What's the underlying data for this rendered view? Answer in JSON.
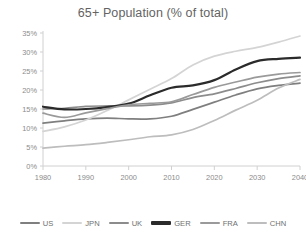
{
  "chart_data": {
    "type": "line",
    "title": "65+ Population (% of total)",
    "xlabel": "",
    "ylabel": "",
    "grid": false,
    "legend_position": "bottom",
    "x": [
      1980,
      1985,
      1990,
      1995,
      2000,
      2005,
      2010,
      2015,
      2020,
      2025,
      2030,
      2035,
      2040
    ],
    "xlim": [
      1980,
      2040
    ],
    "ylim": [
      0,
      35
    ],
    "x_ticks": [
      "1980",
      "1990",
      "2000",
      "2010",
      "2020",
      "2030",
      "2040"
    ],
    "y_ticks": [
      "0%",
      "5%",
      "10%",
      "15%",
      "20%",
      "25%",
      "30%",
      "35%"
    ],
    "y_tick_values": [
      0,
      5,
      10,
      15,
      20,
      25,
      30,
      35
    ],
    "series": [
      {
        "name": "US",
        "color": "#7f7f7f",
        "values": [
          11.3,
          11.9,
          12.4,
          12.6,
          12.4,
          12.4,
          13.1,
          14.9,
          16.8,
          18.7,
          20.3,
          21.2,
          21.8
        ]
      },
      {
        "name": "JPN",
        "color": "#d4d4d4",
        "values": [
          9.1,
          10.3,
          12.1,
          14.6,
          17.4,
          20.2,
          23.0,
          26.6,
          28.9,
          30.2,
          31.2,
          32.6,
          34.2
        ]
      },
      {
        "name": "UK",
        "color": "#8c8c8c",
        "values": [
          15.0,
          15.2,
          15.7,
          15.8,
          15.8,
          16.0,
          16.6,
          18.0,
          19.0,
          20.4,
          21.9,
          23.0,
          23.7
        ]
      },
      {
        "name": "GER",
        "color": "#2b2b2b",
        "values": [
          15.6,
          14.9,
          15.0,
          15.5,
          16.4,
          18.6,
          20.6,
          21.2,
          22.6,
          25.4,
          27.6,
          28.2,
          28.5
        ]
      },
      {
        "name": "FRA",
        "color": "#9a9a9a",
        "values": [
          13.9,
          12.8,
          14.0,
          15.1,
          16.1,
          16.5,
          16.9,
          18.8,
          20.7,
          22.1,
          23.4,
          24.2,
          24.6
        ]
      },
      {
        "name": "CHN",
        "color": "#bdbdbd",
        "values": [
          4.7,
          5.2,
          5.6,
          6.2,
          6.9,
          7.7,
          8.2,
          9.6,
          12.0,
          14.7,
          17.3,
          20.5,
          22.8
        ]
      }
    ]
  },
  "legend": {
    "items": [
      {
        "label": "US"
      },
      {
        "label": "JPN"
      },
      {
        "label": "UK"
      },
      {
        "label": "GER"
      },
      {
        "label": "FRA"
      },
      {
        "label": "CHN"
      }
    ]
  }
}
